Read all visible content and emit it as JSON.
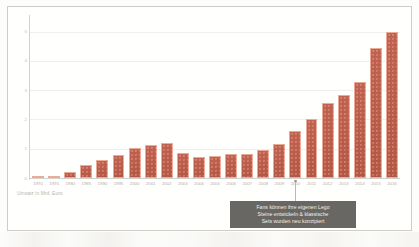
{
  "chart_data": {
    "type": "bar",
    "title": "",
    "subtitle": "",
    "xlabel": "",
    "ylabel": "Umsatz in Mrd. Euro",
    "caption": "Umsatz in Mrd. Euro",
    "ylim": [
      0,
      5.5
    ],
    "grid": true,
    "legend": "none",
    "unit": "Mrd. Euro",
    "bar_color": "#b5432f",
    "bar_outline_color": "#e8a08c",
    "categories": [
      "1970",
      "1975",
      "1980",
      "1985",
      "1990",
      "1995",
      "2000",
      "2001",
      "2002",
      "2003",
      "2004",
      "2005",
      "2006",
      "2007",
      "2008",
      "2009",
      "2010",
      "2011",
      "2012",
      "2013",
      "2014",
      "2015",
      "2016"
    ],
    "values": [
      0.03,
      0.08,
      0.21,
      0.45,
      0.63,
      0.78,
      1.02,
      1.13,
      1.18,
      0.85,
      0.72,
      0.74,
      0.83,
      0.82,
      0.95,
      1.15,
      1.6,
      2.03,
      2.55,
      2.82,
      3.28,
      4.45,
      5.0
    ],
    "y_ticks": [
      "0",
      "1",
      "2",
      "3",
      "4",
      "5"
    ],
    "y_tick_values": [
      0,
      1,
      2,
      3,
      4,
      5
    ],
    "annotations": [
      {
        "anchor_category": "2010",
        "lines": [
          "Fans können ihre eigenen Lego",
          "Steine entwickeln & klassische",
          "Sets wurden neu konzipiert"
        ],
        "box_color": "#55534f",
        "text_color": "#f2efeb"
      }
    ]
  },
  "frame": {
    "border_color": "#c9c6c2",
    "background": "#ffffff"
  }
}
